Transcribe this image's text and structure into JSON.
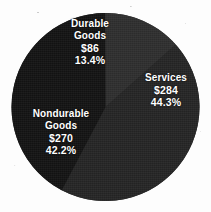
{
  "chart_data": {
    "type": "pie",
    "title": "",
    "subtitle": "",
    "xlabel": "",
    "ylabel": "",
    "legend_position": "none",
    "grid": false,
    "units": "billions of dollars",
    "total_value": 640,
    "categories": [
      "Durable Goods",
      "Services",
      "Nondurable Goods"
    ],
    "values": [
      86,
      284,
      270
    ],
    "percentages": [
      13.4,
      44.3,
      42.2
    ],
    "slices": [
      {
        "name_line1": "Durable",
        "name_line2": "Goods",
        "value_label": "$86",
        "percent_label": "13.4%",
        "value": 86,
        "percent": 13.4,
        "color": "#2f2f2f",
        "start_angle": 289.8,
        "end_angle": 337.9
      },
      {
        "name_line1": "Services",
        "name_line2": "",
        "value_label": "$284",
        "percent_label": "44.3%",
        "value": 284,
        "percent": 44.3,
        "color": "#262626",
        "start_angle": 337.9,
        "end_angle": 497.4
      },
      {
        "name_line1": "Nondurable",
        "name_line2": "Goods",
        "value_label": "$270",
        "percent_label": "42.2%",
        "value": 270,
        "percent": 42.2,
        "color": "#141414",
        "start_angle": 137.4,
        "end_angle": 289.8
      }
    ],
    "label_color": "#ffffff",
    "background_color": "#fdfdfd"
  }
}
